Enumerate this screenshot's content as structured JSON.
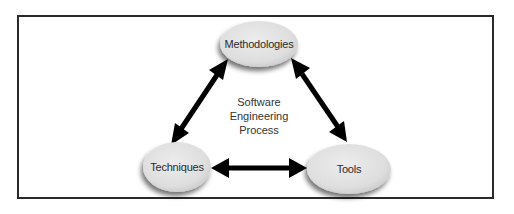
{
  "diagram": {
    "center": {
      "lines": [
        "Software",
        "Engineering",
        "Process"
      ]
    },
    "nodes": [
      {
        "id": "methodologies",
        "label": "Methodologies",
        "cx": 259,
        "cy": 44,
        "rx": 39,
        "ry": 23
      },
      {
        "id": "techniques",
        "label": "Techniques",
        "cx": 177,
        "cy": 167,
        "rx": 34,
        "ry": 25
      },
      {
        "id": "tools",
        "label": "Tools",
        "cx": 349,
        "cy": 169,
        "rx": 42,
        "ry": 25
      }
    ],
    "edges": [
      {
        "from": "techniques",
        "to": "methodologies",
        "type": "bidirectional"
      },
      {
        "from": "methodologies",
        "to": "tools",
        "type": "bidirectional"
      },
      {
        "from": "techniques",
        "to": "tools",
        "type": "bidirectional"
      }
    ],
    "colors": {
      "node_fill": "#e2e2e2",
      "node_shadow": "#9a9a9a",
      "arrow": "#000000",
      "frame": "#2a2a2a"
    }
  }
}
